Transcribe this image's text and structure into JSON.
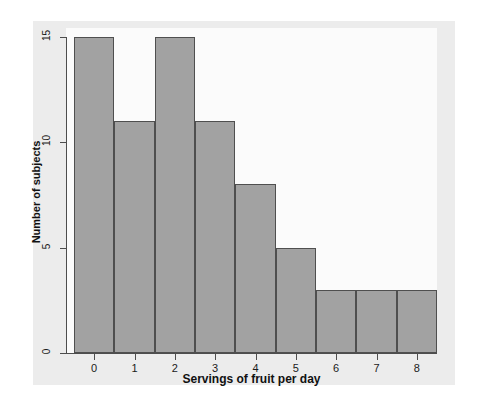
{
  "chart_data": {
    "type": "bar",
    "title": "",
    "subtitle": "",
    "xlabel": "Servings of fruit per day",
    "ylabel": "Number of subjects",
    "categories": [
      "0",
      "1",
      "2",
      "3",
      "4",
      "5",
      "6",
      "7",
      "8"
    ],
    "values": [
      15,
      11,
      15,
      11,
      8,
      5,
      3,
      3,
      3
    ],
    "series": [
      {
        "name": "Number of subjects",
        "values": [
          15,
          11,
          15,
          11,
          8,
          5,
          3,
          3,
          3
        ]
      }
    ],
    "ylim": [
      0,
      15
    ],
    "yticks": [
      "0",
      "5",
      "10",
      "15"
    ],
    "ytick_values": [
      0,
      5,
      10,
      15
    ],
    "xticks": [
      "0",
      "1",
      "2",
      "3",
      "4",
      "5",
      "6",
      "7",
      "8"
    ],
    "grid": false,
    "legend": false,
    "legend_position": "none",
    "bar_gap": 0,
    "colors": {
      "bar_fill": "#a2a2a2",
      "bar_edge": "#4f4f4f",
      "axis": "#4d4d4d",
      "text": "#111111",
      "plot_background": "#fbfbfb",
      "figure_background": "#ececec",
      "page_background": "#ffffff"
    }
  },
  "axes": {
    "y_title": "Number of subjects",
    "x_title": "Servings of fruit per day",
    "y_tick_labels": [
      "0",
      "5",
      "10",
      "15"
    ],
    "x_tick_labels": [
      "0",
      "1",
      "2",
      "3",
      "4",
      "5",
      "6",
      "7",
      "8"
    ]
  }
}
